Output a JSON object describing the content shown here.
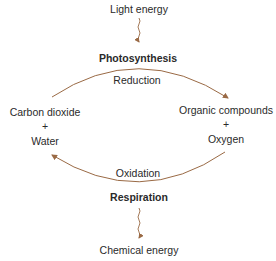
{
  "diagram": {
    "top_energy": "Light energy",
    "top_process": "Photosynthesis",
    "top_arc_label": "Reduction",
    "left_reactant_1": "Carbon dioxide",
    "left_plus": "+",
    "left_reactant_2": "Water",
    "right_product_1": "Organic compounds",
    "right_plus": "+",
    "right_product_2": "Oxygen",
    "bottom_arc_label": "Oxidation",
    "bottom_process": "Respiration",
    "bottom_energy": "Chemical energy",
    "arrow_color": "#9a6a45"
  }
}
